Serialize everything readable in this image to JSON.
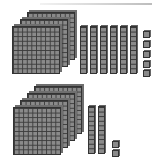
{
  "diagram": {
    "type": "base-ten-blocks",
    "groups": [
      {
        "name": "top-group",
        "hundreds": 3,
        "tens": 6,
        "ones": 5,
        "value": 365
      },
      {
        "name": "bottom-group",
        "hundreds": 4,
        "tens": 2,
        "ones": 2,
        "value": 422
      }
    ],
    "colors": {
      "block_fill": "#8a8a8a",
      "grid_line": "#3c3c3c",
      "background": "#ffffff"
    }
  }
}
